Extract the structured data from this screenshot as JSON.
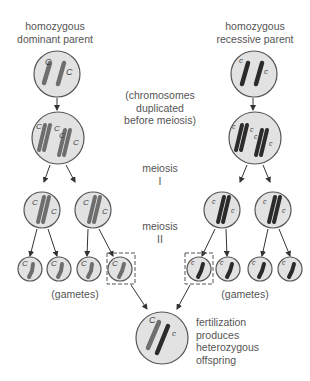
{
  "labels": {
    "dominant_parent": [
      "homozygous",
      "dominant parent"
    ],
    "recessive_parent": [
      "homozygous",
      "recessive parent"
    ],
    "duplication": [
      "(chromosomes",
      "duplicated",
      "before meiosis)"
    ],
    "meiosis1": [
      "meiosis",
      "I"
    ],
    "meiosis2": [
      "meiosis",
      "II"
    ],
    "gametes_left": "(gametes)",
    "gametes_right": "(gametes)",
    "fertilization": [
      "fertilization",
      "produces",
      "heterozygous",
      "offspring"
    ]
  },
  "alleles": {
    "dominant": "C",
    "recessive": "c"
  },
  "colors": {
    "cell_fill": "#e2e2e2",
    "cell_stroke": "#555555",
    "dominant_chromosome": "#6e6e6e",
    "recessive_chromosome": "#2b2b2b",
    "arrow": "#333333"
  }
}
